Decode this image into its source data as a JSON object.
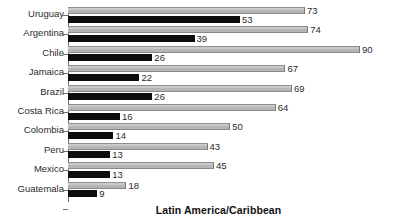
{
  "chart_data": {
    "type": "bar",
    "orientation": "horizontal",
    "title": "",
    "footer_title": "Latin America/Caribbean",
    "xlabel": "",
    "ylabel": "",
    "categories": [
      "Uruguay",
      "Argentina",
      "Chile",
      "Jamaica",
      "Brazil",
      "Costa Rica",
      "Colombia",
      "Peru",
      "Mexico",
      "Guatemala"
    ],
    "series": [
      {
        "name": "light",
        "color": "#b5b5b5",
        "values": [
          73,
          74,
          90,
          67,
          69,
          64,
          50,
          43,
          45,
          18
        ]
      },
      {
        "name": "dark",
        "color": "#0d0d0d",
        "values": [
          53,
          39,
          26,
          22,
          26,
          16,
          14,
          13,
          13,
          9
        ]
      }
    ],
    "xlim": [
      0,
      95
    ],
    "grid": false,
    "legend": "none",
    "axis_color": "#6e6e6e",
    "background": "#ffffff"
  }
}
